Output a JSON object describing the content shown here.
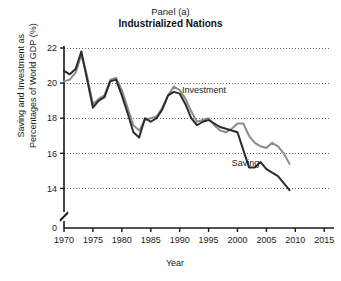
{
  "chart_data": {
    "type": "line",
    "title": "Panel (a)",
    "subtitle": "Industrialized Nations",
    "xlabel": "Year",
    "ylabel_line1": "Saving and Investment as",
    "ylabel_line2": "Percentages of World GDP (%)",
    "xlim": [
      1970,
      2016
    ],
    "ylim": [
      13,
      22
    ],
    "xticks": [
      1970,
      1975,
      1980,
      1985,
      1990,
      1995,
      2000,
      2005,
      2010,
      2015
    ],
    "xticklabels": [
      "1970",
      "1975",
      "1980",
      "1985",
      "1990",
      "1995",
      "2000",
      "2005",
      "2010",
      "2015"
    ],
    "yticks": [
      14,
      16,
      18,
      20,
      22
    ],
    "yticklabels": [
      "14",
      "16",
      "18",
      "20",
      "22"
    ],
    "y_origin_label": "0",
    "axis_break": true,
    "grid": "horizontal-dotted",
    "legend": "inline-annotations",
    "colors": {
      "investment": "#8c8c8c",
      "saving": "#2b2b2b",
      "axis": "#1a1a1a",
      "grid": "#555555",
      "background": "#ffffff"
    },
    "annotations": [
      {
        "text": "Investment",
        "x": 1990.4,
        "y": 19.45
      },
      {
        "text": "Saving",
        "x": 1999.0,
        "y": 15.3
      }
    ],
    "series": [
      {
        "name": "Investment",
        "color": "#8c8c8c",
        "x": [
          1970,
          1971,
          1972,
          1973,
          1974,
          1975,
          1976,
          1977,
          1978,
          1979,
          1980,
          1981,
          1982,
          1983,
          1984,
          1985,
          1986,
          1987,
          1988,
          1989,
          1990,
          1991,
          1992,
          1993,
          1994,
          1995,
          1996,
          1997,
          1998,
          1999,
          2000,
          2001,
          2002,
          2003,
          2004,
          2005,
          2006,
          2007,
          2008,
          2009
        ],
        "values": [
          20.1,
          20.2,
          20.6,
          21.6,
          20.4,
          18.8,
          19.1,
          19.3,
          20.2,
          20.3,
          19.6,
          18.6,
          17.6,
          17.3,
          17.9,
          18.0,
          18.1,
          18.6,
          19.3,
          19.8,
          19.6,
          19.1,
          18.4,
          17.8,
          17.9,
          18.0,
          17.6,
          17.3,
          17.2,
          17.4,
          17.7,
          17.7,
          17.0,
          16.6,
          16.4,
          16.3,
          16.6,
          16.4,
          16.0,
          15.4
        ]
      },
      {
        "name": "Saving",
        "color": "#2b2b2b",
        "x": [
          1970,
          1971,
          1972,
          1973,
          1974,
          1975,
          1976,
          1977,
          1978,
          1979,
          1980,
          1981,
          1982,
          1983,
          1984,
          1985,
          1986,
          1987,
          1988,
          1989,
          1990,
          1991,
          1992,
          1993,
          1994,
          1995,
          1996,
          1997,
          1998,
          1999,
          2000,
          2001,
          2002,
          2003,
          2004,
          2005,
          2006,
          2007,
          2008,
          2009
        ],
        "values": [
          20.7,
          20.5,
          20.8,
          21.8,
          20.2,
          18.6,
          19.0,
          19.2,
          20.1,
          20.2,
          19.3,
          18.3,
          17.2,
          16.9,
          18.0,
          17.8,
          18.0,
          18.5,
          19.3,
          19.5,
          19.4,
          18.8,
          18.0,
          17.6,
          17.8,
          17.9,
          17.7,
          17.5,
          17.4,
          17.3,
          17.2,
          16.2,
          15.2,
          15.2,
          15.5,
          15.1,
          14.9,
          14.7,
          14.3,
          13.9
        ]
      }
    ]
  }
}
